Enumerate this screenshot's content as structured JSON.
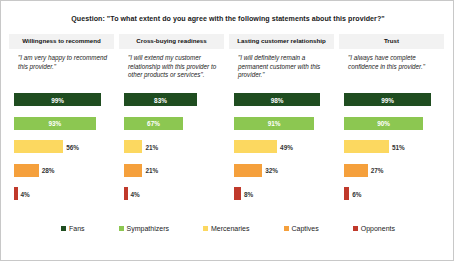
{
  "title": "Question: \"To what extent do you agree with the following statements about this provider?\"",
  "columns": [
    {
      "header": "Willingness to recommend",
      "quote": "\"I am very happy to recommend this provider.\""
    },
    {
      "header": "Cross-buying readiness",
      "quote": "\"I will extend my customer relationship with this provider to other products or services\"."
    },
    {
      "header": "Lasting customer relationship",
      "quote": "\"I will definitely remain a permanent customer with this provider.\""
    },
    {
      "header": "Trust",
      "quote": "\"I always have complete confidence in this provider.\""
    }
  ],
  "legend": [
    {
      "label": "Fans",
      "color": "#1f4d20"
    },
    {
      "label": "Sympathizers",
      "color": "#8cc751"
    },
    {
      "label": "Mercenaries",
      "color": "#fcd860"
    },
    {
      "label": "Captives",
      "color": "#f5a03c"
    },
    {
      "label": "Opponents",
      "color": "#c0392b"
    }
  ],
  "chart_data": {
    "type": "bar",
    "title": "Question: \"To what extent do you agree with the following statements about this provider?\"",
    "xlabel": "",
    "ylabel": "",
    "xlim": [
      0,
      100
    ],
    "grid": false,
    "legend_position": "bottom",
    "value_suffix": "%",
    "categories": [
      "Willingness to recommend",
      "Cross-buying readiness",
      "Lasting customer relationship",
      "Trust"
    ],
    "series": [
      {
        "name": "Fans",
        "color": "#1f4d20",
        "values": [
          99,
          83,
          98,
          99
        ],
        "labels": [
          "99%",
          "83%",
          "98%",
          "99%"
        ]
      },
      {
        "name": "Sympathizers",
        "color": "#8cc751",
        "values": [
          93,
          67,
          91,
          90
        ],
        "labels": [
          "93%",
          "67%",
          "91%",
          "90%"
        ]
      },
      {
        "name": "Mercenaries",
        "color": "#fcd860",
        "values": [
          56,
          21,
          49,
          51
        ],
        "labels": [
          "56%",
          "21%",
          "49%",
          "51%"
        ]
      },
      {
        "name": "Captives",
        "color": "#f5a03c",
        "values": [
          28,
          21,
          32,
          27
        ],
        "labels": [
          "28%",
          "21%",
          "32%",
          "27%"
        ]
      },
      {
        "name": "Opponents",
        "color": "#c0392b",
        "values": [
          4,
          4,
          8,
          6
        ],
        "labels": [
          "4%",
          "4%",
          "8%",
          "6%"
        ]
      }
    ]
  }
}
